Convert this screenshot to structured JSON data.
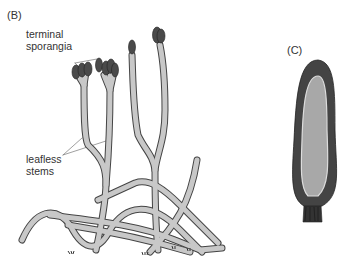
{
  "panels": {
    "b": {
      "label": "(B)",
      "annotations": {
        "sporangia": {
          "line1": "terminal",
          "line2": "sporangia"
        },
        "stems": {
          "line1": "leafless",
          "line2": "stems"
        }
      }
    },
    "c": {
      "label": "(C)"
    }
  },
  "colors": {
    "stem_fill": "#c8c8c8",
    "stem_outline": "#444444",
    "sporangium": "#4a4a4a",
    "spore_mass": "#a8a8a8"
  }
}
